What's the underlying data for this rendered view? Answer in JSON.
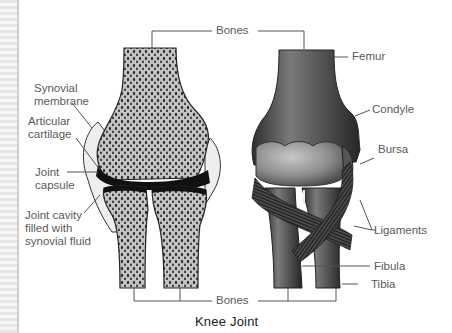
{
  "figure": {
    "title": "Knee Joint",
    "left_view": {
      "labels": {
        "synovial_membrane": [
          "Synovial",
          "membrane"
        ],
        "articular_cartilage": [
          "Articular",
          "cartilage"
        ],
        "joint_capsule": [
          "Joint",
          "capsule"
        ],
        "joint_cavity": [
          "Joint cavity",
          "filled with",
          "synovial fluid"
        ]
      }
    },
    "right_view": {
      "labels": {
        "femur": "Femur",
        "condyle": "Condyle",
        "bursa": "Bursa",
        "ligaments": "Ligaments",
        "fibula": "Fibula",
        "tibia": "Tibia"
      }
    },
    "shared_labels": {
      "bones_top": "Bones",
      "bones_bottom": "Bones"
    },
    "colors": {
      "bone_fill": "#c4c4c4",
      "spongy_dots": "#2a2a2a",
      "cartilage": "#111111",
      "capsule": "#eeeeee",
      "outer_bone_dark": "#4a4a4a",
      "label_text": "#5a5a5a",
      "leader_line": "#555555"
    }
  }
}
